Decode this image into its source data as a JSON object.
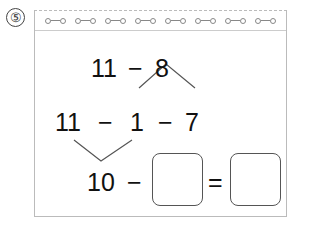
{
  "question": {
    "number": "⑤"
  },
  "line1": {
    "a": "11",
    "op": "−",
    "b": "8"
  },
  "line2": {
    "a": "11",
    "op1": "−",
    "b": "1",
    "op2": "−",
    "c": "7"
  },
  "line3": {
    "a": "10",
    "op": "−",
    "eq": "="
  },
  "answer_boxes": [
    {
      "value": ""
    },
    {
      "value": ""
    }
  ],
  "rings_count": 8
}
